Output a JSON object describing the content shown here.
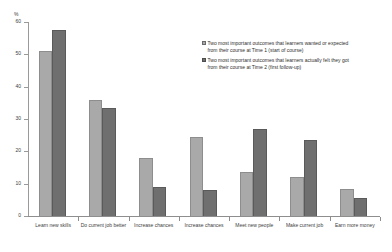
{
  "chart_data": {
    "type": "bar",
    "title": "",
    "subtitle": "",
    "xlabel": "",
    "ylabel": "%",
    "ylim": [
      0,
      60
    ],
    "ytick_labels": [
      "0",
      "10",
      "20",
      "30",
      "40",
      "50",
      "60"
    ],
    "ytick_values": [
      0,
      10,
      20,
      30,
      40,
      50,
      60
    ],
    "grid": false,
    "legend_position": "upper-right",
    "categories": [
      "Learn new skills",
      "Do current job better",
      "Increase chances",
      "Increase chances",
      "Meet new people",
      "Make current job",
      "Earn more money"
    ],
    "series": [
      {
        "name": "Two most important outcomes that learners wanted or expected from their course at Time 1 (start of course)",
        "color": "#a9a9a9",
        "values": [
          51,
          36,
          18,
          24.5,
          13.5,
          12,
          8.5
        ]
      },
      {
        "name": "Two most important outcomes that learners actually felt they got from their course at Time 2 (first follow-up)",
        "color": "#6f6f6f",
        "values": [
          57.5,
          33.5,
          9,
          8,
          27,
          23.5,
          5.5
        ]
      }
    ]
  },
  "axis": {
    "unit_label": "%"
  },
  "legend": {
    "items": [
      {
        "label": "Two most important outcomes that learners wanted or expected from their course at Time 1 (start of course)",
        "swatch": "legend-swatch-light"
      },
      {
        "label": "Two most important outcomes that learners actually felt they got from their course at Time 2 (first follow-up)",
        "swatch": "legend-swatch-dark"
      }
    ]
  }
}
